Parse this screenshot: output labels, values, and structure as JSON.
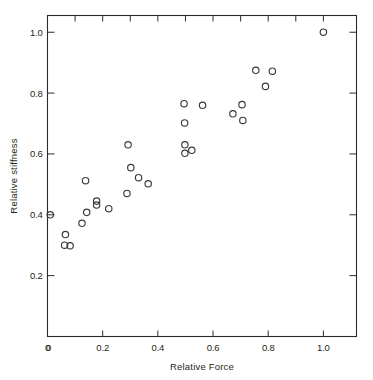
{
  "chart_data": {
    "type": "scatter",
    "title": "",
    "xlabel": "Relative  Force",
    "ylabel": "Relative  stiffness",
    "xlim": [
      0,
      1.12
    ],
    "ylim": [
      0,
      1.055
    ],
    "grid": false,
    "legend": null,
    "marker": "open-circle",
    "marker_color": "#3a3a3a",
    "xticks": [
      0,
      0.2,
      0.4,
      0.6,
      0.8,
      1.0
    ],
    "xticklabels": [
      "0",
      "0.2",
      "0.4",
      "0.6",
      "0.8",
      "1.0"
    ],
    "yticks": [
      0.2,
      0.4,
      0.6,
      0.8,
      1.0
    ],
    "yticklabels": [
      "0.2",
      "0.4",
      "0.6",
      "0.8",
      "1.0"
    ],
    "y_origin_label": "0",
    "minor_ticks_top": [
      0.1,
      0.3,
      0.5,
      0.7,
      0.9
    ],
    "minor_ticks_right": [
      0.1,
      0.3,
      0.5,
      0.7,
      0.9
    ],
    "points": [
      {
        "x": 0.01,
        "y": 0.4
      },
      {
        "x": 0.065,
        "y": 0.335
      },
      {
        "x": 0.062,
        "y": 0.3
      },
      {
        "x": 0.082,
        "y": 0.298
      },
      {
        "x": 0.125,
        "y": 0.372
      },
      {
        "x": 0.138,
        "y": 0.512
      },
      {
        "x": 0.142,
        "y": 0.408
      },
      {
        "x": 0.178,
        "y": 0.445
      },
      {
        "x": 0.178,
        "y": 0.432
      },
      {
        "x": 0.222,
        "y": 0.42
      },
      {
        "x": 0.288,
        "y": 0.47
      },
      {
        "x": 0.292,
        "y": 0.63
      },
      {
        "x": 0.302,
        "y": 0.555
      },
      {
        "x": 0.33,
        "y": 0.522
      },
      {
        "x": 0.365,
        "y": 0.502
      },
      {
        "x": 0.495,
        "y": 0.765
      },
      {
        "x": 0.497,
        "y": 0.702
      },
      {
        "x": 0.498,
        "y": 0.63
      },
      {
        "x": 0.498,
        "y": 0.602
      },
      {
        "x": 0.523,
        "y": 0.612
      },
      {
        "x": 0.562,
        "y": 0.76
      },
      {
        "x": 0.672,
        "y": 0.732
      },
      {
        "x": 0.705,
        "y": 0.762
      },
      {
        "x": 0.708,
        "y": 0.71
      },
      {
        "x": 0.755,
        "y": 0.875
      },
      {
        "x": 0.79,
        "y": 0.822
      },
      {
        "x": 0.815,
        "y": 0.872
      },
      {
        "x": 1.0,
        "y": 1.0
      }
    ]
  },
  "axes": {
    "x_label_text": "Relative  Force",
    "y_label_text": "Relative  stiffness"
  }
}
